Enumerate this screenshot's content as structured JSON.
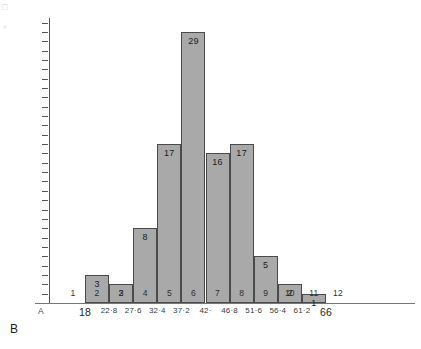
{
  "chart_data": {
    "type": "bar",
    "title": "",
    "subtitle": "",
    "xlabel": "",
    "ylabel": "",
    "ylim": [
      0,
      30
    ],
    "grid": false,
    "legend": "none",
    "bar_color": "#a9a9a9",
    "bar_outline_color": "#4a4a4a",
    "axis_color": "#555555",
    "categories": [
      "1",
      "2",
      "3",
      "4",
      "5",
      "6",
      "7",
      "8",
      "9",
      "10",
      "11",
      "12"
    ],
    "values": [
      0,
      3,
      2,
      8,
      17,
      29,
      16,
      17,
      5,
      2,
      1,
      0
    ],
    "bin_edges": [
      "18",
      "22·8",
      "27·6",
      "32·4",
      "37·2",
      "42·",
      "46·8",
      "51·6",
      "56·4",
      "61·2",
      "66"
    ],
    "y_ticks": [
      "30.",
      "29.",
      "28.",
      "27.",
      "26.",
      "25.",
      "24.",
      "23.",
      "22.",
      "21.",
      "20.",
      "19.",
      "18.",
      "17.",
      "16.",
      "15.",
      "14.",
      "13.",
      "12.",
      "11.",
      "10.",
      "9.",
      "8.",
      "7.",
      "6.",
      "5.",
      "4.",
      "3.",
      "2.",
      "1."
    ],
    "y_tick_values": [
      30,
      29,
      28,
      27,
      26,
      25,
      24,
      23,
      22,
      21,
      20,
      19,
      18,
      17,
      16,
      15,
      14,
      13,
      12,
      11,
      10,
      9,
      8,
      7,
      6,
      5,
      4,
      3,
      2,
      1
    ],
    "bar_labels": [
      "",
      "3",
      "2",
      "8",
      "17",
      "29",
      "16",
      "17",
      "5",
      "2",
      "1",
      ""
    ],
    "annotations": {
      "axis_origin_letter": "A",
      "figure_letter": "B"
    }
  }
}
